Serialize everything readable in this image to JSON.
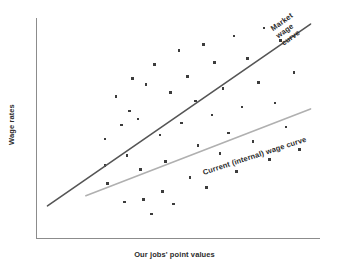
{
  "chart_data": {
    "type": "scatter",
    "title": "",
    "xlabel": "Our jobs' point values",
    "ylabel": "Wage rates",
    "grid": false,
    "legend_position": "inline-annotations",
    "axis_color": "#8c8c8c",
    "xlim": [
      0,
      100
    ],
    "ylim": [
      0,
      100
    ],
    "x_ticks": [],
    "y_ticks": [],
    "marker_color": "#3c3c3c",
    "points": [
      {
        "x": 23,
        "y": 41
      },
      {
        "x": 23,
        "y": 28
      },
      {
        "x": 24,
        "y": 19
      },
      {
        "x": 27,
        "y": 62
      },
      {
        "x": 29,
        "y": 48
      },
      {
        "x": 30,
        "y": 10
      },
      {
        "x": 31,
        "y": 33
      },
      {
        "x": 32,
        "y": 55
      },
      {
        "x": 33,
        "y": 71
      },
      {
        "x": 35,
        "y": 51
      },
      {
        "x": 36,
        "y": 26
      },
      {
        "x": 37,
        "y": 11
      },
      {
        "x": 38,
        "y": 68
      },
      {
        "x": 40,
        "y": 4
      },
      {
        "x": 41,
        "y": 78
      },
      {
        "x": 43,
        "y": 43
      },
      {
        "x": 44,
        "y": 15
      },
      {
        "x": 45,
        "y": 30
      },
      {
        "x": 47,
        "y": 64
      },
      {
        "x": 48,
        "y": 9
      },
      {
        "x": 50,
        "y": 85
      },
      {
        "x": 51,
        "y": 49
      },
      {
        "x": 53,
        "y": 72
      },
      {
        "x": 54,
        "y": 22
      },
      {
        "x": 56,
        "y": 60
      },
      {
        "x": 57,
        "y": 38
      },
      {
        "x": 59,
        "y": 88
      },
      {
        "x": 60,
        "y": 17
      },
      {
        "x": 62,
        "y": 53
      },
      {
        "x": 63,
        "y": 79
      },
      {
        "x": 65,
        "y": 34
      },
      {
        "x": 66,
        "y": 66
      },
      {
        "x": 68,
        "y": 44
      },
      {
        "x": 70,
        "y": 92
      },
      {
        "x": 71,
        "y": 25
      },
      {
        "x": 73,
        "y": 57
      },
      {
        "x": 75,
        "y": 81
      },
      {
        "x": 77,
        "y": 40
      },
      {
        "x": 79,
        "y": 69
      },
      {
        "x": 81,
        "y": 96
      },
      {
        "x": 83,
        "y": 31
      },
      {
        "x": 85,
        "y": 59
      },
      {
        "x": 87,
        "y": 90
      },
      {
        "x": 89,
        "y": 47
      },
      {
        "x": 92,
        "y": 74
      },
      {
        "x": 94,
        "y": 36
      }
    ],
    "series": [
      {
        "name": "Market wage curve",
        "type": "line",
        "color": "#555555",
        "label": "Market wage curve",
        "label_lines": [
          "Market",
          "wage",
          "curve"
        ],
        "start": {
          "x": 2,
          "y": 8
        },
        "end": {
          "x": 98,
          "y": 98
        }
      },
      {
        "name": "Current (internal) wage curve",
        "type": "line",
        "color": "#b0b0b0",
        "label": "Current (internal) wage curve",
        "label_lines": [
          "Current (internal) wage curve"
        ],
        "start": {
          "x": 16,
          "y": 13
        },
        "end": {
          "x": 98,
          "y": 56
        }
      }
    ]
  }
}
